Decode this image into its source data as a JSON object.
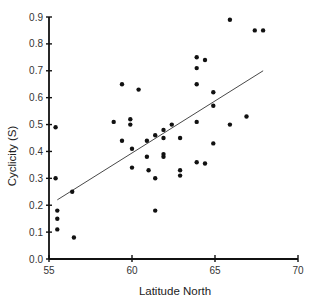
{
  "chart_data": {
    "type": "scatter",
    "title": "",
    "xlabel": "Latitude North",
    "ylabel": "Cyclicity (S)",
    "xlim": [
      55,
      70
    ],
    "ylim": [
      0.0,
      0.9
    ],
    "x_ticks": [
      55,
      60,
      65,
      70
    ],
    "x_tick_labels": [
      "55",
      "60",
      "65",
      "70"
    ],
    "y_ticks": [
      0.0,
      0.1,
      0.2,
      0.3,
      0.4,
      0.5,
      0.6,
      0.7,
      0.8,
      0.9
    ],
    "y_tick_labels": [
      "0.0",
      "0.1",
      "0.2",
      "0.3",
      "0.4",
      "0.5",
      "0.6",
      "0.7",
      "0.8",
      "0.9"
    ],
    "grid": false,
    "legend": null,
    "series": [
      {
        "name": "observations",
        "marker": "filled-circle",
        "color": "#111111",
        "points": [
          [
            55.4,
            0.49
          ],
          [
            55.4,
            0.3
          ],
          [
            55.5,
            0.18
          ],
          [
            55.5,
            0.15
          ],
          [
            55.5,
            0.11
          ],
          [
            56.4,
            0.25
          ],
          [
            56.5,
            0.08
          ],
          [
            58.9,
            0.51
          ],
          [
            59.4,
            0.65
          ],
          [
            59.4,
            0.44
          ],
          [
            59.9,
            0.52
          ],
          [
            59.9,
            0.5
          ],
          [
            60.0,
            0.41
          ],
          [
            60.0,
            0.34
          ],
          [
            60.4,
            0.63
          ],
          [
            60.9,
            0.44
          ],
          [
            60.9,
            0.38
          ],
          [
            61.0,
            0.33
          ],
          [
            61.4,
            0.46
          ],
          [
            61.4,
            0.3
          ],
          [
            61.4,
            0.18
          ],
          [
            61.9,
            0.48
          ],
          [
            61.9,
            0.45
          ],
          [
            61.9,
            0.39
          ],
          [
            61.9,
            0.38
          ],
          [
            62.4,
            0.5
          ],
          [
            62.9,
            0.45
          ],
          [
            62.9,
            0.33
          ],
          [
            62.9,
            0.31
          ],
          [
            63.9,
            0.75
          ],
          [
            63.9,
            0.71
          ],
          [
            63.9,
            0.65
          ],
          [
            63.9,
            0.51
          ],
          [
            63.9,
            0.36
          ],
          [
            64.4,
            0.74
          ],
          [
            64.4,
            0.355
          ],
          [
            64.9,
            0.62
          ],
          [
            64.9,
            0.57
          ],
          [
            64.9,
            0.43
          ],
          [
            65.9,
            0.89
          ],
          [
            65.9,
            0.5
          ],
          [
            66.9,
            0.53
          ],
          [
            67.4,
            0.85
          ],
          [
            67.9,
            0.85
          ]
        ]
      },
      {
        "name": "regression-line",
        "type": "line",
        "color": "#333333",
        "points": [
          [
            55.5,
            0.22
          ],
          [
            67.9,
            0.7
          ]
        ]
      }
    ]
  }
}
